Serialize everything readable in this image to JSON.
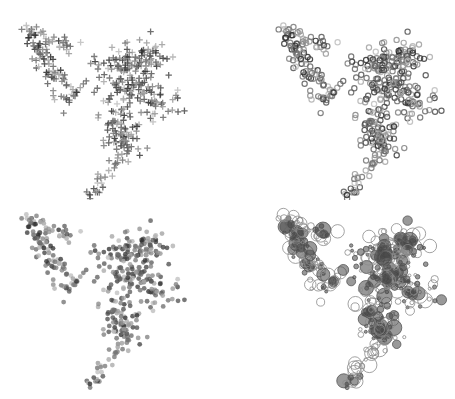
{
  "chart_data": [
    {
      "type": "scatter",
      "panel": "top-left",
      "marker": "plus",
      "title": "",
      "xlabel": "",
      "ylabel": "",
      "grid": false,
      "legend": null,
      "description": "Point cloud shaped like a '9' rendered with '+' markers, grayscale intensity varying per point"
    },
    {
      "type": "scatter",
      "panel": "top-right",
      "marker": "hollow-circle-small",
      "title": "",
      "xlabel": "",
      "ylabel": "",
      "grid": false,
      "legend": null,
      "description": "Same point cloud rendered with small hollow circle markers, grayscale stroke"
    },
    {
      "type": "scatter",
      "panel": "bottom-left",
      "marker": "filled-circle",
      "title": "",
      "xlabel": "",
      "ylabel": "",
      "grid": false,
      "legend": null,
      "description": "Same point cloud rendered with small filled dots, grayscale fill"
    },
    {
      "type": "scatter",
      "panel": "bottom-right",
      "marker": "hollow-circle-variable-size",
      "title": "",
      "xlabel": "",
      "ylabel": "",
      "grid": false,
      "legend": null,
      "description": "Same point cloud rendered with hollow circles of variable radius"
    }
  ],
  "shape": {
    "segments": [
      {
        "name": "left-arm",
        "from": [
          28,
          25
        ],
        "to": [
          68,
          100
        ],
        "spread": 5,
        "count": 90
      },
      {
        "name": "small-cluster",
        "from": [
          48,
          36
        ],
        "to": [
          72,
          52
        ],
        "spread": 4,
        "count": 16
      },
      {
        "name": "arm-tail",
        "from": [
          70,
          100
        ],
        "to": [
          82,
          82
        ],
        "spread": 3,
        "count": 8
      },
      {
        "name": "upper-body",
        "from": [
          118,
          60
        ],
        "to": [
          160,
          55
        ],
        "spread": 8,
        "count": 70
      },
      {
        "name": "mid-body",
        "from": [
          120,
          80
        ],
        "to": [
          150,
          100
        ],
        "spread": 14,
        "count": 140
      },
      {
        "name": "lower-body",
        "from": [
          112,
          115
        ],
        "to": [
          130,
          150
        ],
        "spread": 8,
        "count": 70
      },
      {
        "name": "tail",
        "from": [
          122,
          155
        ],
        "to": [
          90,
          195
        ],
        "spread": 4,
        "count": 30
      },
      {
        "name": "strays",
        "from": [
          95,
          60
        ],
        "to": [
          108,
          72
        ],
        "spread": 6,
        "count": 6
      }
    ],
    "seed": 20240517
  },
  "panels": [
    {
      "id": "tl",
      "x": 0,
      "y": 0,
      "dx": 0,
      "dy": 0
    },
    {
      "id": "tr",
      "x": 227,
      "y": 0,
      "dx": 30,
      "dy": 0
    },
    {
      "id": "bl",
      "x": 0,
      "y": 199,
      "dx": 0,
      "dy": -10
    },
    {
      "id": "br",
      "x": 227,
      "y": 199,
      "dx": 30,
      "dy": -10
    }
  ],
  "colors": {
    "background": "#ffffff",
    "dark": "#2a2a2a",
    "mid": "#666666",
    "light": "#b0b0b0"
  }
}
